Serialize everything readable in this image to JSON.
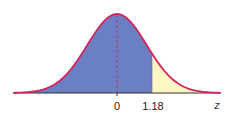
{
  "chart_data": {
    "type": "area",
    "title": "",
    "xlabel": "z",
    "ylabel": "",
    "distribution": "standard normal",
    "mean": 0,
    "std": 1,
    "xlim": [
      -3.5,
      3.5
    ],
    "ticks": [
      {
        "value": 0,
        "label": "0"
      },
      {
        "value": 1.18,
        "label": "1.18"
      }
    ],
    "regions": [
      {
        "name": "left-of-z",
        "from": -3.5,
        "to": 1.18,
        "color": "#6b7fc4"
      },
      {
        "name": "right-of-z",
        "from": 1.18,
        "to": 3.5,
        "color": "#fdf7c3"
      }
    ],
    "reference_lines": [
      {
        "x": 0,
        "style": "dashed",
        "color": "#b03a6a"
      }
    ],
    "grid": false,
    "legend": null
  },
  "colors": {
    "curve": "#d4245c",
    "left_fill": "#6b7fc4",
    "right_fill": "#fdf7c3",
    "axis": "#333333",
    "dashed": "#b03a6a"
  },
  "labels": {
    "tick_zero": "0",
    "tick_z": "1.18",
    "axis_var": "z"
  }
}
